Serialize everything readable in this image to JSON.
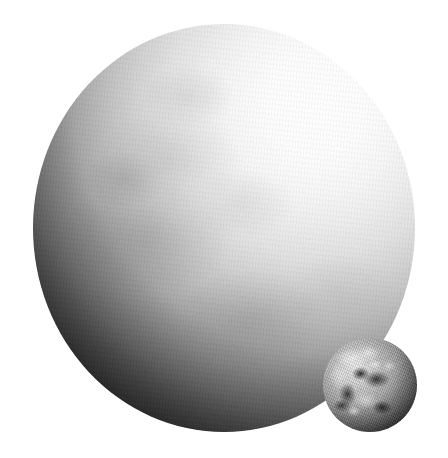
{
  "scene": {
    "title": "Pluto and Earth size comparison",
    "description": "Grayscale composite showing a large mottled icy world lit from the upper right beside a much smaller cloud-covered globe at the lower right.",
    "background_color": "#ffffff",
    "width": 448,
    "height": 458,
    "text_labels": [],
    "light_source": "upper-right"
  },
  "bodies": [
    {
      "name": "large-body",
      "label": "Pluto",
      "shape": "sphere",
      "center_x": 224,
      "center_y": 228,
      "radius_x": 191,
      "radius_y": 204,
      "diameter_px": 382,
      "surface": "mottled icy terrain with bright and dark patches",
      "illumination": "lit from upper right, terminator sweeping across lower left",
      "colors": {
        "highlight": "#ffffff",
        "midtone": "#bdbdbd",
        "shadow": "#1d1d1d",
        "terminator": "#030303"
      }
    },
    {
      "name": "small-body",
      "label": "Earth",
      "shape": "sphere",
      "center_x": 370,
      "center_y": 385,
      "radius_x": 47,
      "radius_y": 47,
      "diameter_px": 95,
      "surface": "continents and swirling cloud bands in grayscale",
      "illumination": "lit from upper left, right limb in deep shadow",
      "colors": {
        "highlight": "#efefef",
        "midtone": "#9a9a9a",
        "shadow": "#2a2a2a",
        "terminator": "#141414"
      }
    }
  ]
}
